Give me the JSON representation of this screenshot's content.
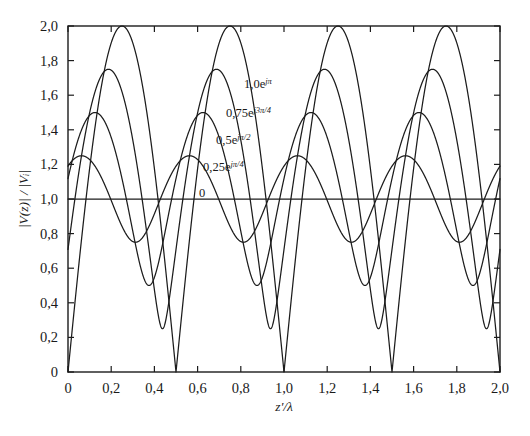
{
  "chart_data": {
    "type": "line",
    "title": "",
    "subtitle": "",
    "xlabel": "z'/λ",
    "ylabel": "|V(z)| / |Vᵢ|",
    "xlim": [
      0,
      2.0
    ],
    "ylim": [
      0,
      2.0
    ],
    "grid": false,
    "legend_position": "inline-annotations",
    "xticks": [
      0,
      0.2,
      0.4,
      0.6,
      0.8,
      1.0,
      1.2,
      1.4,
      1.6,
      1.8,
      2.0
    ],
    "xticklabels": [
      "0",
      "0,2",
      "0,4",
      "0,6",
      "0,8",
      "1,0",
      "1,2",
      "1,4",
      "1,6",
      "1,8",
      "2,0"
    ],
    "yticks": [
      0,
      0.2,
      0.4,
      0.6,
      0.8,
      1.0,
      1.2,
      1.4,
      1.6,
      1.8,
      2.0
    ],
    "yticklabels": [
      "0",
      "0,2",
      "0,4",
      "0,6",
      "0,8",
      "1,0",
      "1,2",
      "1,4",
      "1,6",
      "1,8",
      "2,0"
    ],
    "formula": "|V(z)|/|Vi| = |1 + Γ e^(-j4π z'/λ)|",
    "series": [
      {
        "name": "0",
        "gamma_magnitude": 0.0,
        "gamma_phase_rad": 0.0,
        "max": 1.0,
        "min": 1.0,
        "color": "#1c1c1c"
      },
      {
        "name": "0,25e^{jπ/4}",
        "gamma_magnitude": 0.25,
        "gamma_phase_rad": 0.7853981634,
        "max": 1.25,
        "min": 0.75,
        "peak_x": 0.0625,
        "color": "#1c1c1c"
      },
      {
        "name": "0,5e^{jπ/2}",
        "gamma_magnitude": 0.5,
        "gamma_phase_rad": 1.5707963268,
        "max": 1.5,
        "min": 0.5,
        "peak_x": 0.125,
        "color": "#1c1c1c"
      },
      {
        "name": "0,75e^{j3π/4}",
        "gamma_magnitude": 0.75,
        "gamma_phase_rad": 2.3561944902,
        "max": 1.75,
        "min": 0.25,
        "peak_x": 0.1875,
        "color": "#1c1c1c"
      },
      {
        "name": "1,0e^{jπ}",
        "gamma_magnitude": 1.0,
        "gamma_phase_rad": 3.1415926536,
        "max": 2.0,
        "min": 0.0,
        "peak_x": 0.25,
        "color": "#1c1c1c"
      }
    ]
  },
  "annotations": [
    {
      "id": "ann-gamma-1",
      "mantissa": "1,0e",
      "exponent": "jπ",
      "x": 244,
      "y": 88
    },
    {
      "id": "ann-gamma-075",
      "mantissa": "0,75e",
      "exponent": "j3π/4",
      "x": 226,
      "y": 117
    },
    {
      "id": "ann-gamma-05",
      "mantissa": "0,5e",
      "exponent": "jπ/2",
      "x": 216,
      "y": 144
    },
    {
      "id": "ann-gamma-025",
      "mantissa": "0,25e",
      "exponent": "jπ/4",
      "x": 203,
      "y": 171
    },
    {
      "id": "ann-gamma-0",
      "mantissa": "0",
      "exponent": "",
      "x": 199,
      "y": 197
    }
  ],
  "axis_titles": {
    "x": "z'/λ",
    "y_numerator": "|V(z)|",
    "y_separator": " / ",
    "y_denominator": "|Vᵢ|"
  }
}
